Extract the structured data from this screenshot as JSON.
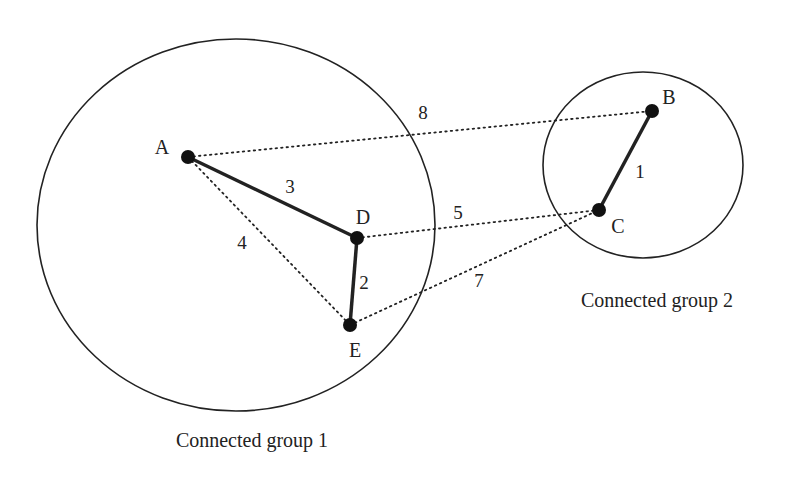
{
  "groups": [
    {
      "label": "Connected group 1",
      "cx": 236,
      "cy": 225,
      "rx": 199,
      "ry": 186,
      "label_x": 252,
      "label_y": 447
    },
    {
      "label": "Connected group 2",
      "cx": 643,
      "cy": 165,
      "rx": 100,
      "ry": 93,
      "label_x": 657,
      "label_y": 307
    }
  ],
  "nodes": [
    {
      "id": "A",
      "x": 188,
      "y": 157,
      "lx": 162,
      "ly": 154
    },
    {
      "id": "B",
      "x": 652,
      "y": 111,
      "lx": 669,
      "ly": 104
    },
    {
      "id": "C",
      "x": 599,
      "y": 210,
      "lx": 618,
      "ly": 233
    },
    {
      "id": "D",
      "x": 357,
      "y": 238,
      "lx": 363,
      "ly": 224
    },
    {
      "id": "E",
      "x": 350,
      "y": 325,
      "lx": 355,
      "ly": 357
    }
  ],
  "edges": [
    {
      "from": "A",
      "to": "D",
      "weight": "3",
      "style": "solid",
      "wx": 290,
      "wy": 193
    },
    {
      "from": "D",
      "to": "E",
      "weight": "2",
      "style": "solid",
      "wx": 364,
      "wy": 289
    },
    {
      "from": "B",
      "to": "C",
      "weight": "1",
      "style": "solid",
      "wx": 640,
      "wy": 178
    },
    {
      "from": "A",
      "to": "E",
      "weight": "4",
      "style": "dotted",
      "wx": 242,
      "wy": 249
    },
    {
      "from": "A",
      "to": "B",
      "weight": "8",
      "style": "dotted",
      "wx": 423,
      "wy": 119
    },
    {
      "from": "D",
      "to": "C",
      "weight": "5",
      "style": "dotted",
      "wx": 458,
      "wy": 219
    },
    {
      "from": "E",
      "to": "C",
      "weight": "7",
      "style": "dotted",
      "wx": 479,
      "wy": 287
    }
  ]
}
